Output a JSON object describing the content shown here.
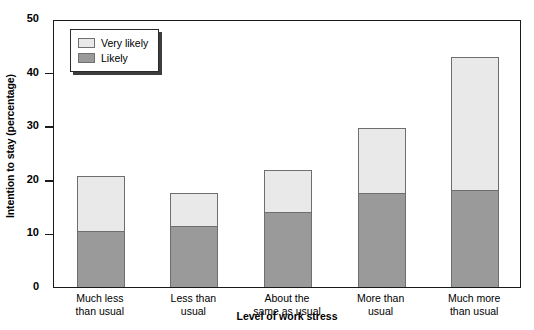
{
  "chart_data": {
    "type": "bar",
    "subtype": "stacked-vertical",
    "title": "",
    "xlabel": "Level of work stress",
    "ylabel": "Intention to stay (percentage)",
    "categories": [
      "Much less\nthan usual",
      "Less than\nusual",
      "About the\nsame as usual",
      "More than\nusual",
      "Much more\nthan usual"
    ],
    "series": [
      {
        "name": "Likely",
        "color": "#9a9a9a",
        "values": [
          10.4,
          11.4,
          14.0,
          17.5,
          18.1
        ]
      },
      {
        "name": "Very likely",
        "color": "#e9e9e9",
        "values": [
          10.3,
          6.2,
          7.8,
          12.2,
          24.8
        ]
      }
    ],
    "stack_totals": [
      20.7,
      17.6,
      21.8,
      29.7,
      42.9
    ],
    "ylim": [
      0,
      50
    ],
    "yticks": [
      0,
      10,
      20,
      30,
      40,
      50
    ],
    "ytick_labels": [
      "0",
      "10",
      "20",
      "30",
      "40",
      "50"
    ],
    "grid": false,
    "legend_position": "upper left",
    "legend_entries": [
      {
        "label": "Very likely",
        "color": "#e9e9e9"
      },
      {
        "label": "Likely",
        "color": "#9a9a9a"
      }
    ],
    "axis_color": "#1a1a1a",
    "bar_border_color": "#6e6e6e"
  }
}
